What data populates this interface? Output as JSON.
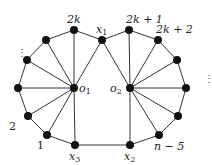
{
  "diagram": {
    "title": "",
    "nodes": [
      {
        "id": "o1",
        "x": 74,
        "y": 88,
        "label": "o1",
        "label_dx": 5,
        "label_dy": 4
      },
      {
        "id": "o2",
        "x": 130,
        "y": 88,
        "label": "o2",
        "label_dx": -20,
        "label_dy": 4
      },
      {
        "id": "x1",
        "x": 102,
        "y": 40,
        "label": "x1",
        "label_dx": -6,
        "label_dy": -7
      },
      {
        "id": "x2",
        "x": 130,
        "y": 145,
        "label": "x2",
        "label_dx": -6,
        "label_dy": 15
      },
      {
        "id": "x3",
        "x": 75,
        "y": 145,
        "label": "x3",
        "label_dx": -6,
        "label_dy": 15
      },
      {
        "id": "v2k",
        "x": 74,
        "y": 30,
        "label": "2k",
        "label_dx": -7,
        "label_dy": -7
      },
      {
        "id": "vL1",
        "x": 46,
        "y": 40,
        "label": "",
        "label_dx": 0,
        "label_dy": 0
      },
      {
        "id": "vL2",
        "x": 27,
        "y": 60,
        "label": "",
        "label_dx": 0,
        "label_dy": 0
      },
      {
        "id": "vL3",
        "x": 18,
        "y": 88,
        "label": "",
        "label_dx": 0,
        "label_dy": 0
      },
      {
        "id": "v2",
        "x": 28,
        "y": 116,
        "label": "2",
        "label_dx": -19,
        "label_dy": 14
      },
      {
        "id": "v1",
        "x": 47,
        "y": 135,
        "label": "1",
        "label_dx": -10,
        "label_dy": 14
      },
      {
        "id": "v2k1",
        "x": 129,
        "y": 30,
        "label": "2k + 1",
        "label_dx": -3,
        "label_dy": -7
      },
      {
        "id": "v2k2",
        "x": 158,
        "y": 40,
        "label": "2k + 2",
        "label_dx": -2,
        "label_dy": -7
      },
      {
        "id": "vR1",
        "x": 177,
        "y": 60,
        "label": "",
        "label_dx": 0,
        "label_dy": 0
      },
      {
        "id": "vR2",
        "x": 186,
        "y": 88,
        "label": "",
        "label_dx": 0,
        "label_dy": 0
      },
      {
        "id": "vR3",
        "x": 178,
        "y": 116,
        "label": "",
        "label_dx": 0,
        "label_dy": 0
      },
      {
        "id": "vn5",
        "x": 159,
        "y": 135,
        "label": "n − 5",
        "label_dx": -5,
        "label_dy": 15
      }
    ],
    "edges": [
      [
        "v1",
        "v2"
      ],
      [
        "v2",
        "vL3"
      ],
      [
        "vL3",
        "vL2"
      ],
      [
        "vL2",
        "vL1"
      ],
      [
        "vL1",
        "v2k"
      ],
      [
        "v2k",
        "x1"
      ],
      [
        "x1",
        "v2k1"
      ],
      [
        "v2k1",
        "v2k2"
      ],
      [
        "v2k2",
        "vR1"
      ],
      [
        "vR1",
        "vR2"
      ],
      [
        "vR2",
        "vR3"
      ],
      [
        "vR3",
        "vn5"
      ],
      [
        "vn5",
        "x2"
      ],
      [
        "x2",
        "x3"
      ],
      [
        "x3",
        "v1"
      ],
      [
        "o1",
        "v1"
      ],
      [
        "o1",
        "v2"
      ],
      [
        "o1",
        "vL3"
      ],
      [
        "o1",
        "vL2"
      ],
      [
        "o1",
        "vL1"
      ],
      [
        "o1",
        "v2k"
      ],
      [
        "o1",
        "x1"
      ],
      [
        "o1",
        "x3"
      ],
      [
        "o2",
        "x1"
      ],
      [
        "o2",
        "v2k1"
      ],
      [
        "o2",
        "v2k2"
      ],
      [
        "o2",
        "vR1"
      ],
      [
        "o2",
        "vR2"
      ],
      [
        "o2",
        "vR3"
      ],
      [
        "o2",
        "vn5"
      ],
      [
        "o2",
        "x2"
      ]
    ],
    "ellipses": [
      {
        "x": 17,
        "y": 56,
        "text": "⋮"
      },
      {
        "x": 204,
        "y": 82,
        "text": "⋮"
      }
    ],
    "colors": {
      "node": "#111111",
      "edge": "#333333",
      "text": "#222222"
    }
  }
}
